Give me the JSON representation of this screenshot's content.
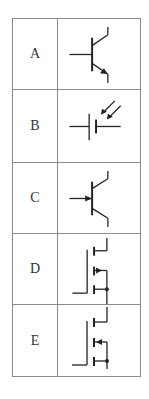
{
  "table": {
    "rows": [
      {
        "label": "A",
        "symbol": "npn-transistor-icon",
        "description": "NPN bipolar junction transistor (emitter arrow pointing outward)"
      },
      {
        "label": "B",
        "symbol": "photovoltaic-cell-icon",
        "description": "Cell/battery with incoming light arrows (photocell)"
      },
      {
        "label": "C",
        "symbol": "pnp-transistor-icon",
        "description": "Transistor with arrow on base input line"
      },
      {
        "label": "D",
        "symbol": "n-channel-mosfet-icon",
        "description": "Enhancement MOSFET, arrow pointing in toward channel"
      },
      {
        "label": "E",
        "symbol": "p-channel-mosfet-icon",
        "description": "Enhancement MOSFET, arrow pointing out from channel"
      }
    ]
  },
  "colors": {
    "border": "#8a8a8a",
    "ink": "#222222",
    "label_text": "#333333",
    "background": "#ffffff"
  }
}
